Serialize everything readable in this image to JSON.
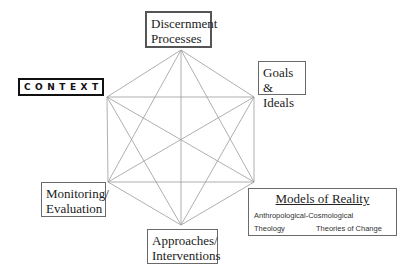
{
  "diagram": {
    "type": "complete-hexagon-graph",
    "nodes": [
      {
        "id": "discernment",
        "lines": [
          "Discernment",
          "Processes"
        ]
      },
      {
        "id": "goals",
        "lines": [
          "Goals &",
          "Ideals"
        ]
      },
      {
        "id": "models",
        "lines": [
          "Models of Reality"
        ]
      },
      {
        "id": "approaches",
        "lines": [
          "Approaches/",
          "Interventions"
        ]
      },
      {
        "id": "monitoring",
        "lines": [
          "Monitoring/",
          "Evaluation"
        ]
      },
      {
        "id": "context",
        "lines": [
          "CONTEXT"
        ]
      }
    ],
    "edges": "all-pairs"
  },
  "labels": {
    "discernment": {
      "line1": "Discernment",
      "line2": "Processes"
    },
    "goals": {
      "line1": "Goals &",
      "line2": "Ideals"
    },
    "monitoring": {
      "line1": "Monitoring/",
      "line2": "Evaluation"
    },
    "approaches": {
      "line1": "Approaches/",
      "line2": "Interventions"
    },
    "context": "CONTEXT",
    "models": {
      "title": "Models of Reality",
      "items": [
        "Anthropological-Cosmological",
        "Theology",
        "Theories of Change"
      ]
    }
  }
}
